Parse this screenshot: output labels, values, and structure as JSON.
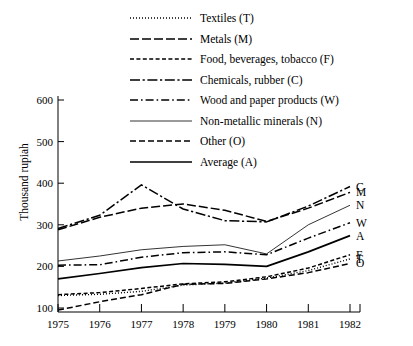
{
  "chart_data": {
    "type": "line",
    "title": "",
    "subtitle": "",
    "xlabel": "",
    "ylabel": "Thousand rupiah",
    "x": [
      1975,
      1976,
      1977,
      1978,
      1979,
      1980,
      1981,
      1982
    ],
    "xtick_labels": [
      "1975",
      "1976",
      "1977",
      "1978",
      "1979",
      "1980",
      "1981",
      "1982"
    ],
    "ytick_labels": [
      "100",
      "200",
      "300",
      "400",
      "500",
      "600"
    ],
    "yticks": [
      100,
      200,
      300,
      400,
      500,
      600
    ],
    "xlim": [
      1975,
      1982
    ],
    "ylim": [
      80,
      600
    ],
    "grid": false,
    "legend_position": "top-center",
    "series": [
      {
        "name": "Textiles (T)",
        "code": "T",
        "style": "dotted",
        "end_label": "T",
        "values": [
          130,
          133,
          140,
          155,
          160,
          172,
          190,
          218
        ]
      },
      {
        "name": "Metals (M)",
        "code": "M",
        "style": "long-dash",
        "end_label": "M",
        "values": [
          288,
          318,
          340,
          350,
          335,
          308,
          340,
          378
        ]
      },
      {
        "name": "Food, beverages, tobacco (F)",
        "code": "F",
        "style": "short-dash",
        "end_label": "F",
        "values": [
          132,
          137,
          147,
          158,
          163,
          175,
          196,
          228
        ]
      },
      {
        "name": "Chemicals, rubber (C)",
        "code": "C",
        "style": "dash-dot-long",
        "end_label": "C",
        "values": [
          291,
          323,
          396,
          338,
          310,
          307,
          345,
          392
        ]
      },
      {
        "name": "Wood and paper products (W)",
        "code": "W",
        "style": "dash-dot",
        "end_label": "W",
        "values": [
          203,
          204,
          222,
          233,
          235,
          228,
          268,
          305
        ]
      },
      {
        "name": "Non-metallic minerals (N)",
        "code": "N",
        "style": "thin-solid",
        "end_label": "N",
        "values": [
          213,
          225,
          240,
          248,
          252,
          230,
          300,
          347
        ]
      },
      {
        "name": "Other (O)",
        "code": "O",
        "style": "dashed",
        "end_label": "O",
        "values": [
          95,
          115,
          132,
          157,
          159,
          170,
          185,
          207
        ]
      },
      {
        "name": "Average (A)",
        "code": "A",
        "style": "solid",
        "end_label": "A",
        "values": [
          170,
          183,
          197,
          207,
          205,
          200,
          235,
          274
        ]
      }
    ],
    "legend": [
      {
        "label": "Textiles (T)",
        "style": "dotted"
      },
      {
        "label": "Metals (M)",
        "style": "long-dash"
      },
      {
        "label": "Food, beverages, tobacco (F)",
        "style": "short-dash"
      },
      {
        "label": "Chemicals, rubber (C)",
        "style": "dash-dot-long"
      },
      {
        "label": "Wood and paper products (W)",
        "style": "dash-dot"
      },
      {
        "label": "Non-metallic minerals (N)",
        "style": "thin-solid"
      },
      {
        "label": "Other (O)",
        "style": "dashed"
      },
      {
        "label": "Average (A)",
        "style": "solid"
      }
    ],
    "colors": {
      "line": "#000000",
      "axis": "#000000",
      "background": "#ffffff"
    }
  }
}
